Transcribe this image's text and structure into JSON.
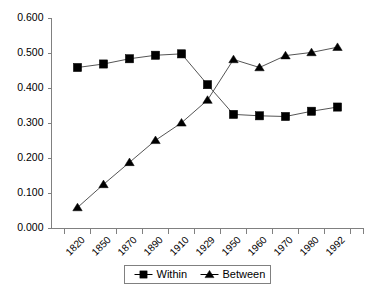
{
  "chart_data": {
    "type": "line",
    "title": "",
    "subtitle": "",
    "xlabel": "",
    "ylabel": "",
    "categories": [
      "1820",
      "1850",
      "1870",
      "1890",
      "1910",
      "1929",
      "1950",
      "1960",
      "1970",
      "1980",
      "1992"
    ],
    "series": [
      {
        "name": "Within",
        "marker": "square",
        "color": "#000000",
        "values": [
          0.46,
          0.47,
          0.485,
          0.495,
          0.499,
          0.411,
          0.326,
          0.322,
          0.32,
          0.335,
          0.347
        ]
      },
      {
        "name": "Between",
        "marker": "triangle",
        "color": "#000000",
        "values": [
          0.06,
          0.126,
          0.189,
          0.252,
          0.302,
          0.367,
          0.483,
          0.46,
          0.494,
          0.503,
          0.518
        ]
      }
    ],
    "ylim": [
      0.0,
      0.6
    ],
    "yticks": [
      0.0,
      0.1,
      0.2,
      0.3,
      0.4,
      0.5,
      0.6
    ],
    "ytick_labels": [
      "0.000",
      "0.100",
      "0.200",
      "0.300",
      "0.400",
      "0.500",
      "0.600"
    ],
    "grid": false,
    "legend_position": "bottom"
  },
  "legend": {
    "items": [
      {
        "label": "Within",
        "marker": "square-marker-icon"
      },
      {
        "label": "Between",
        "marker": "triangle-marker-icon"
      }
    ]
  }
}
